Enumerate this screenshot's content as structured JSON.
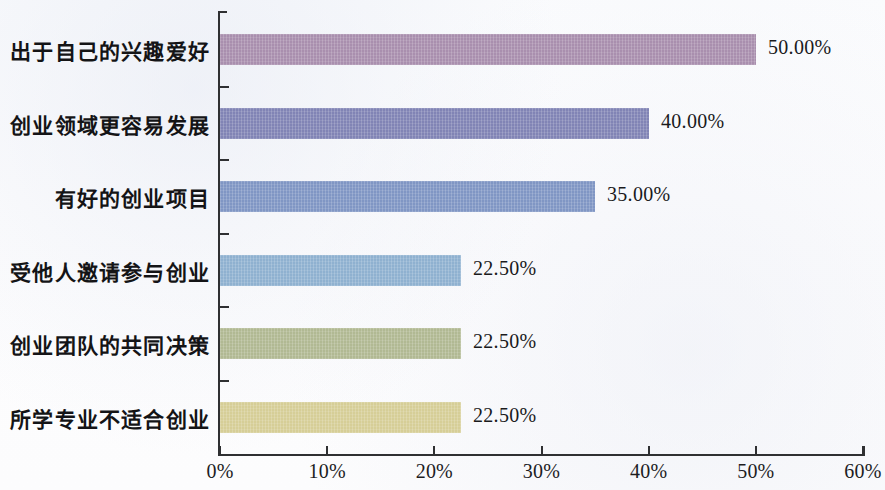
{
  "chart_data": {
    "type": "bar",
    "orientation": "horizontal",
    "title": "",
    "subtitle": "",
    "xlabel": "",
    "ylabel": "",
    "xlim": [
      0,
      60
    ],
    "xtick_labels": [
      "0%",
      "10%",
      "20%",
      "30%",
      "40%",
      "50%",
      "60%"
    ],
    "xtick_values": [
      0,
      10,
      20,
      30,
      40,
      50,
      60
    ],
    "grid": false,
    "legend": false,
    "value_label_format": "0.00%",
    "categories": [
      "出于自己的兴趣爱好",
      "创业领域更容易发展",
      "有好的创业项目",
      "受他人邀请参与创业",
      "创业团队的共同决策",
      "所学专业不适合创业"
    ],
    "values": [
      50.0,
      40.0,
      35.0,
      22.5,
      22.5,
      22.5
    ],
    "value_labels": [
      "50.00%",
      "40.00%",
      "35.00%",
      "22.50%",
      "22.50%",
      "22.50%"
    ],
    "bar_colors": [
      "#a98fae",
      "#8184b5",
      "#8096c4",
      "#8fb1d0",
      "#b1b993",
      "#d6ce97"
    ]
  }
}
